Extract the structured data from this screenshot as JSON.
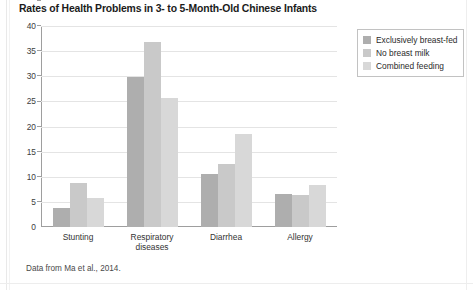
{
  "figure": {
    "title": "Rates of Health Problems in 3- to 5-Month-Old Chinese Infants",
    "source_note": "Data from Ma et al., 2014."
  },
  "legend": {
    "position": "top-right",
    "entries": [
      {
        "label": "Exclusively breast-fed",
        "color": "#aeaeae",
        "icon": "legend-swatch"
      },
      {
        "label": "No breast milk",
        "color": "#c9c9c9",
        "icon": "legend-swatch"
      },
      {
        "label": "Combined feeding",
        "color": "#d8d8d8",
        "icon": "legend-swatch"
      }
    ]
  },
  "chart_data": {
    "type": "bar",
    "title": "Rates of Health Problems in 3- to 5-Month-Old Chinese Infants",
    "xlabel": "",
    "ylabel": "",
    "ylim": [
      0,
      40
    ],
    "yticks": [
      0,
      5,
      10,
      15,
      20,
      25,
      30,
      35,
      40
    ],
    "ytick_labels": [
      "0",
      "5",
      "10",
      "15",
      "20",
      "25",
      "30",
      "35",
      "40"
    ],
    "grid": true,
    "grid_axis": "y",
    "legend_position": "top-right",
    "categories": [
      "Stunting",
      "Respiratory diseases",
      "Diarrhea",
      "Allergy"
    ],
    "category_label_lines": [
      [
        "Stunting"
      ],
      [
        "Respiratory",
        "diseases"
      ],
      [
        "Diarrhea"
      ],
      [
        "Allergy"
      ]
    ],
    "series": [
      {
        "name": "Exclusively breast-fed",
        "color": "#aeaeae",
        "values": [
          3.8,
          29.9,
          10.6,
          6.5
        ]
      },
      {
        "name": "No breast milk",
        "color": "#c9c9c9",
        "values": [
          8.7,
          36.8,
          12.6,
          6.4
        ]
      },
      {
        "name": "Combined feeding",
        "color": "#d8d8d8",
        "values": [
          5.7,
          25.7,
          18.5,
          8.3
        ]
      }
    ]
  }
}
